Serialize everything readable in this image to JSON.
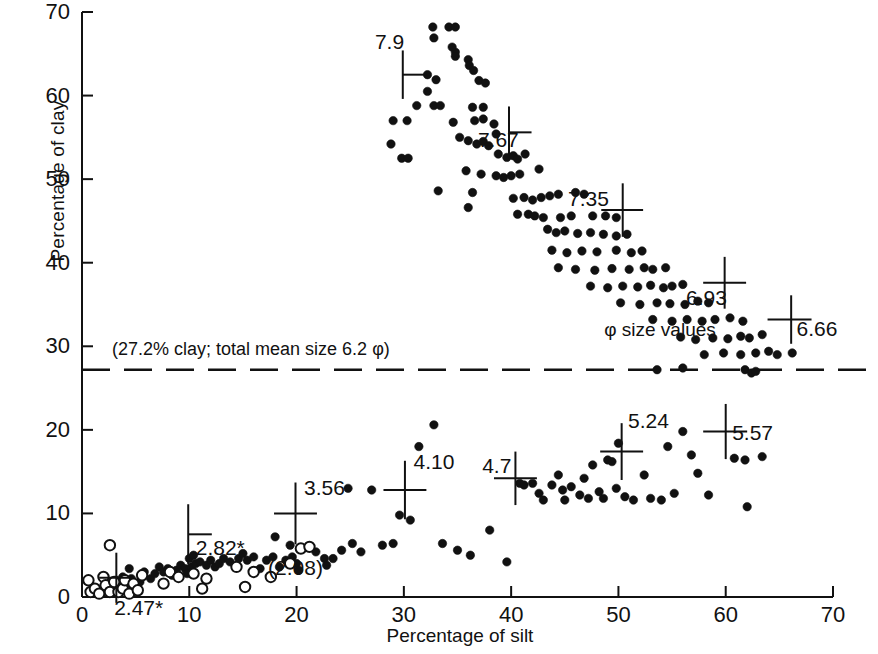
{
  "chart_data": {
    "type": "scatter",
    "title": "",
    "xlabel": "Percentage of silt",
    "ylabel": "Percentage of clay",
    "xlim": [
      0,
      70
    ],
    "ylim": [
      0,
      70
    ],
    "xticks": [
      0,
      10,
      20,
      30,
      40,
      50,
      60,
      70
    ],
    "yticks": [
      0,
      10,
      20,
      30,
      40,
      50,
      60,
      70
    ],
    "grid": false,
    "legend_position": "none",
    "annotations": {
      "divider_note": "(27.2% clay; total mean size 6.2 φ)",
      "divider_y": 27.2,
      "divider_style": "dashed",
      "phi_caption": "φ size values"
    },
    "series": [
      {
        "name": "upper-cluster-filled",
        "marker": "filled-circle",
        "points": [
          [
            32.7,
            68.2
          ],
          [
            34.2,
            68.2
          ],
          [
            34.8,
            68.2
          ],
          [
            32.8,
            66.9
          ],
          [
            34.8,
            65.2
          ],
          [
            34.8,
            64.7
          ],
          [
            34.5,
            65.8
          ],
          [
            36.0,
            64.3
          ],
          [
            36.1,
            63.6
          ],
          [
            32.2,
            62.5
          ],
          [
            33.0,
            61.9
          ],
          [
            32.2,
            60.5
          ],
          [
            36.5,
            63.0
          ],
          [
            37.0,
            61.8
          ],
          [
            37.6,
            61.5
          ],
          [
            31.2,
            58.8
          ],
          [
            32.8,
            58.8
          ],
          [
            33.4,
            58.8
          ],
          [
            36.4,
            58.6
          ],
          [
            37.4,
            58.6
          ],
          [
            29.0,
            57.0
          ],
          [
            30.3,
            57.0
          ],
          [
            34.6,
            56.8
          ],
          [
            36.6,
            57.0
          ],
          [
            37.4,
            57.2
          ],
          [
            38.4,
            56.6
          ],
          [
            28.8,
            54.2
          ],
          [
            35.2,
            55.0
          ],
          [
            36.0,
            54.6
          ],
          [
            36.8,
            54.2
          ],
          [
            37.4,
            54.5
          ],
          [
            37.9,
            54.0
          ],
          [
            38.6,
            55.4
          ],
          [
            29.8,
            52.5
          ],
          [
            30.4,
            52.5
          ],
          [
            38.8,
            53.0
          ],
          [
            39.6,
            52.6
          ],
          [
            40.2,
            52.8
          ],
          [
            40.6,
            52.4
          ],
          [
            41.3,
            53.0
          ],
          [
            35.8,
            51.0
          ],
          [
            37.2,
            50.6
          ],
          [
            38.6,
            50.4
          ],
          [
            39.3,
            50.2
          ],
          [
            40.0,
            50.4
          ],
          [
            40.8,
            50.6
          ],
          [
            42.6,
            51.2
          ],
          [
            33.2,
            48.6
          ],
          [
            36.4,
            48.4
          ],
          [
            40.2,
            47.7
          ],
          [
            41.2,
            47.8
          ],
          [
            42.0,
            47.5
          ],
          [
            42.8,
            47.8
          ],
          [
            43.6,
            48.0
          ],
          [
            44.4,
            48.2
          ],
          [
            46.0,
            48.4
          ],
          [
            46.8,
            48.2
          ],
          [
            36.0,
            46.6
          ],
          [
            40.6,
            45.8
          ],
          [
            41.6,
            45.8
          ],
          [
            42.2,
            45.6
          ],
          [
            43.0,
            45.4
          ],
          [
            44.6,
            45.4
          ],
          [
            45.6,
            45.6
          ],
          [
            47.6,
            45.6
          ],
          [
            48.8,
            45.6
          ],
          [
            49.8,
            45.4
          ],
          [
            43.4,
            44.0
          ],
          [
            44.2,
            43.6
          ],
          [
            45.0,
            43.8
          ],
          [
            46.2,
            43.5
          ],
          [
            47.4,
            43.6
          ],
          [
            48.6,
            43.4
          ],
          [
            49.8,
            43.2
          ],
          [
            50.8,
            43.4
          ],
          [
            43.8,
            41.5
          ],
          [
            45.2,
            41.2
          ],
          [
            46.6,
            41.4
          ],
          [
            48.0,
            41.3
          ],
          [
            49.8,
            41.5
          ],
          [
            51.2,
            41.2
          ],
          [
            52.2,
            41.4
          ],
          [
            44.4,
            39.4
          ],
          [
            46.0,
            39.2
          ],
          [
            47.8,
            39.1
          ],
          [
            49.4,
            39.3
          ],
          [
            51.0,
            39.2
          ],
          [
            52.4,
            39.4
          ],
          [
            53.2,
            39.2
          ],
          [
            54.4,
            39.4
          ],
          [
            47.4,
            37.2
          ],
          [
            49.0,
            37.0
          ],
          [
            50.4,
            37.2
          ],
          [
            51.8,
            37.1
          ],
          [
            53.0,
            37.3
          ],
          [
            54.2,
            37.0
          ],
          [
            55.0,
            37.2
          ],
          [
            56.0,
            37.4
          ],
          [
            50.2,
            35.2
          ],
          [
            52.0,
            35.0
          ],
          [
            53.6,
            35.2
          ],
          [
            54.8,
            35.1
          ],
          [
            56.2,
            35.0
          ],
          [
            57.4,
            35.4
          ],
          [
            58.4,
            35.2
          ],
          [
            53.2,
            33.2
          ],
          [
            55.0,
            33.0
          ],
          [
            56.4,
            33.2
          ],
          [
            57.8,
            33.0
          ],
          [
            59.0,
            33.2
          ],
          [
            60.4,
            33.4
          ],
          [
            61.6,
            33.0
          ],
          [
            55.8,
            31.1
          ],
          [
            57.2,
            30.8
          ],
          [
            58.8,
            31.0
          ],
          [
            60.2,
            30.9
          ],
          [
            61.4,
            31.2
          ],
          [
            62.2,
            31.0
          ],
          [
            63.4,
            31.4
          ],
          [
            58.0,
            29.0
          ],
          [
            59.8,
            29.2
          ],
          [
            61.4,
            29.0
          ],
          [
            62.8,
            29.2
          ],
          [
            64.0,
            29.4
          ],
          [
            64.8,
            29.0
          ],
          [
            66.2,
            29.2
          ],
          [
            53.6,
            27.2
          ],
          [
            61.8,
            27.2
          ],
          [
            62.4,
            26.8
          ],
          [
            62.8,
            27.0
          ],
          [
            56.0,
            27.4
          ]
        ]
      },
      {
        "name": "lower-cluster-filled",
        "marker": "filled-circle",
        "points": [
          [
            1.8,
            0.8
          ],
          [
            2.4,
            1.4
          ],
          [
            2.8,
            1.0
          ],
          [
            3.2,
            2.0
          ],
          [
            3.6,
            1.2
          ],
          [
            3.8,
            2.4
          ],
          [
            4.2,
            1.6
          ],
          [
            4.6,
            2.2
          ],
          [
            5.0,
            1.0
          ],
          [
            5.4,
            1.8
          ],
          [
            4.4,
            3.4
          ],
          [
            5.8,
            3.0
          ],
          [
            6.4,
            2.2
          ],
          [
            6.8,
            2.8
          ],
          [
            7.2,
            3.6
          ],
          [
            7.6,
            3.0
          ],
          [
            8.0,
            3.4
          ],
          [
            8.4,
            2.6
          ],
          [
            8.8,
            3.2
          ],
          [
            9.2,
            3.8
          ],
          [
            9.6,
            3.4
          ],
          [
            9.8,
            2.8
          ],
          [
            10.2,
            3.6
          ],
          [
            10.6,
            4.0
          ],
          [
            10.0,
            4.6
          ],
          [
            10.4,
            5.0
          ],
          [
            11.0,
            4.2
          ],
          [
            11.6,
            3.8
          ],
          [
            12.0,
            4.4
          ],
          [
            12.4,
            3.6
          ],
          [
            12.8,
            4.0
          ],
          [
            13.2,
            4.6
          ],
          [
            13.8,
            4.2
          ],
          [
            14.6,
            4.6
          ],
          [
            15.0,
            5.2
          ],
          [
            15.4,
            4.4
          ],
          [
            16.0,
            4.8
          ],
          [
            16.6,
            3.4
          ],
          [
            17.2,
            4.4
          ],
          [
            17.8,
            4.8
          ],
          [
            18.4,
            3.6
          ],
          [
            19.0,
            4.4
          ],
          [
            19.6,
            4.8
          ],
          [
            20.0,
            4.0
          ],
          [
            20.2,
            3.2
          ],
          [
            18.0,
            7.2
          ],
          [
            19.4,
            6.2
          ],
          [
            21.8,
            5.4
          ],
          [
            22.6,
            4.6
          ],
          [
            22.8,
            3.8
          ],
          [
            23.4,
            4.6
          ],
          [
            24.2,
            5.6
          ],
          [
            24.8,
            13.0
          ],
          [
            25.2,
            6.4
          ],
          [
            26.0,
            5.4
          ],
          [
            27.0,
            12.8
          ],
          [
            28.0,
            6.2
          ],
          [
            29.0,
            6.4
          ],
          [
            29.6,
            9.8
          ],
          [
            30.6,
            9.2
          ],
          [
            31.4,
            18.0
          ],
          [
            32.8,
            20.6
          ],
          [
            33.6,
            6.4
          ],
          [
            35.0,
            5.6
          ],
          [
            36.2,
            5.0
          ],
          [
            38.0,
            8.0
          ],
          [
            39.6,
            4.2
          ],
          [
            40.8,
            13.6
          ],
          [
            41.2,
            13.4
          ],
          [
            42.0,
            13.6
          ],
          [
            42.6,
            12.4
          ],
          [
            43.0,
            11.6
          ],
          [
            43.8,
            13.4
          ],
          [
            44.4,
            14.6
          ],
          [
            44.8,
            12.8
          ],
          [
            45.0,
            11.6
          ],
          [
            45.6,
            13.2
          ],
          [
            46.4,
            12.2
          ],
          [
            46.8,
            14.2
          ],
          [
            47.2,
            11.8
          ],
          [
            47.6,
            15.8
          ],
          [
            48.2,
            12.6
          ],
          [
            48.6,
            11.8
          ],
          [
            49.0,
            16.4
          ],
          [
            49.4,
            16.2
          ],
          [
            49.8,
            13.0
          ],
          [
            50.0,
            18.4
          ],
          [
            50.6,
            12.0
          ],
          [
            51.4,
            11.6
          ],
          [
            52.4,
            14.6
          ],
          [
            53.0,
            11.8
          ],
          [
            54.0,
            11.6
          ],
          [
            54.6,
            18.0
          ],
          [
            55.2,
            12.4
          ],
          [
            56.0,
            19.8
          ],
          [
            56.8,
            17.0
          ],
          [
            57.4,
            14.8
          ],
          [
            58.4,
            12.2
          ],
          [
            60.8,
            16.6
          ],
          [
            61.8,
            16.4
          ],
          [
            62.0,
            10.8
          ],
          [
            63.4,
            16.8
          ]
        ]
      },
      {
        "name": "lower-cluster-open",
        "marker": "open-circle",
        "points": [
          [
            0.6,
            2.0
          ],
          [
            0.8,
            0.6
          ],
          [
            1.2,
            1.0
          ],
          [
            1.6,
            0.4
          ],
          [
            2.0,
            2.4
          ],
          [
            2.2,
            1.4
          ],
          [
            2.6,
            0.6
          ],
          [
            3.0,
            1.8
          ],
          [
            3.4,
            0.6
          ],
          [
            3.8,
            1.0
          ],
          [
            4.0,
            2.0
          ],
          [
            4.4,
            0.4
          ],
          [
            4.8,
            1.6
          ],
          [
            5.2,
            0.8
          ],
          [
            2.6,
            6.2
          ],
          [
            5.6,
            2.6
          ],
          [
            7.6,
            1.6
          ],
          [
            8.2,
            3.0
          ],
          [
            9.0,
            2.4
          ],
          [
            10.4,
            2.8
          ],
          [
            11.6,
            2.2
          ],
          [
            14.4,
            3.6
          ],
          [
            16.0,
            3.0
          ],
          [
            17.6,
            2.4
          ],
          [
            19.4,
            4.0
          ],
          [
            20.4,
            5.8
          ],
          [
            21.2,
            6.0
          ],
          [
            11.2,
            1.0
          ],
          [
            15.2,
            1.2
          ]
        ]
      }
    ],
    "crosses": [
      {
        "label": "7.9",
        "x": 29.9,
        "y": 62.5,
        "label_x": 27.3,
        "label_y": 65.6,
        "hw_left": 0.0,
        "hw_right": 2.2,
        "vh": 2.9
      },
      {
        "label": "7.67",
        "x": 39.8,
        "y": 55.6,
        "label_x": 36.9,
        "label_y": 53.9,
        "hw_left": 0.0,
        "hw_right": 2.1,
        "vh": 3.1
      },
      {
        "label": "7.35",
        "x": 50.4,
        "y": 46.3,
        "label_x": 45.3,
        "label_y": 46.8,
        "hw_left": 2.0,
        "hw_right": 1.9,
        "vh": 3.2
      },
      {
        "label": "6.93",
        "x": 59.9,
        "y": 37.6,
        "label_x": 56.3,
        "label_y": 35.0,
        "hw_left": 2.0,
        "hw_right": 2.0,
        "vh": 3.1
      },
      {
        "label": "6.66",
        "x": 66.1,
        "y": 33.2,
        "label_x": 66.6,
        "label_y": 31.2,
        "hw_left": 2.2,
        "hw_right": 1.9,
        "vh": 2.9
      },
      {
        "label": "2.82*",
        "x": 9.9,
        "y": 7.5,
        "label_x": 10.6,
        "label_y": 5.0,
        "hw_left": 0.0,
        "hw_right": 2.2,
        "vh": 3.6
      },
      {
        "label": "2.47*",
        "x": 3.2,
        "y": 2.3,
        "label_x": 3.0,
        "label_y": -2.2,
        "hw_left": 1.6,
        "hw_right": 1.6,
        "vh": 3.0
      },
      {
        "label": "3.56",
        "x": 19.9,
        "y": 10.0,
        "label_x": 20.7,
        "label_y": 12.2,
        "hw_left": 2.0,
        "hw_right": 2.0,
        "vh": 3.7
      },
      {
        "label": "4.10",
        "x": 30.1,
        "y": 12.8,
        "label_x": 30.9,
        "label_y": 15.3,
        "hw_left": 2.0,
        "hw_right": 2.0,
        "vh": 3.5
      },
      {
        "label": "4.7",
        "x": 40.4,
        "y": 14.2,
        "label_x": 37.3,
        "label_y": 14.8,
        "hw_left": 2.0,
        "hw_right": 2.0,
        "vh": 3.2
      },
      {
        "label": "5.24",
        "x": 50.3,
        "y": 17.4,
        "label_x": 50.9,
        "label_y": 20.2,
        "hw_left": 2.0,
        "hw_right": 2.0,
        "vh": 3.4
      },
      {
        "label": "5.57",
        "x": 60.0,
        "y": 19.8,
        "label_x": 60.6,
        "label_y": 18.8,
        "hw_left": 2.1,
        "hw_right": 2.0,
        "vh": 3.3
      }
    ],
    "extra_labels": [
      {
        "name": "paren-2-08",
        "text": "(2.08)",
        "x": 19.9,
        "y": 2.6
      }
    ]
  }
}
